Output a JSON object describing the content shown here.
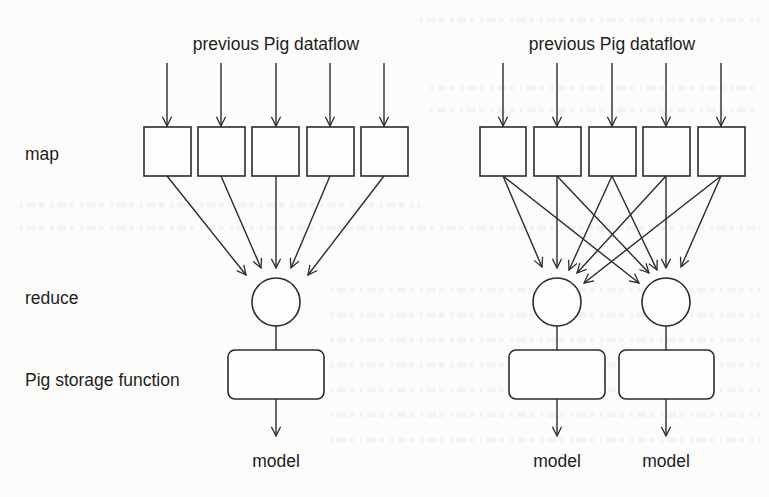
{
  "colors": {
    "background": "#fcfcfb",
    "stroke": "#2b2b2b",
    "text": "#1e1e1e"
  },
  "row_labels": {
    "map": "map",
    "reduce": "reduce",
    "storage": "Pig storage function"
  },
  "left_diagram": {
    "title": "previous Pig dataflow",
    "map_tasks": 5,
    "reducers": 1,
    "storage_functions": 1,
    "outputs": [
      "model"
    ]
  },
  "right_diagram": {
    "title": "previous Pig dataflow",
    "map_tasks": 5,
    "reducers": 2,
    "storage_functions": 2,
    "outputs": [
      "model",
      "model"
    ]
  }
}
